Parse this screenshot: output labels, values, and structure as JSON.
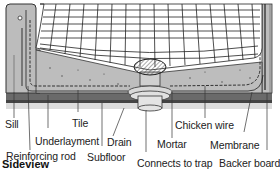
{
  "diagram": {
    "title": "Sideview",
    "labels": {
      "sill": "Sill",
      "reinforcing_rod": "Reinforcing rod",
      "underlayment": "Underlayment",
      "tile": "Tile",
      "subfloor": "Subfloor",
      "drain": "Drain",
      "connects_to_trap": "Connects to trap",
      "mortar": "Mortar",
      "chicken_wire": "Chicken wire",
      "membrane": "Membrane",
      "backer_board": "Backer board"
    },
    "colors": {
      "tile_grid": "#222222",
      "mortar": "#bdbdbd",
      "subfloor_dark": "#555555",
      "subfloor_light": "#d9d9d9",
      "drain": "#cfcfcf"
    }
  }
}
